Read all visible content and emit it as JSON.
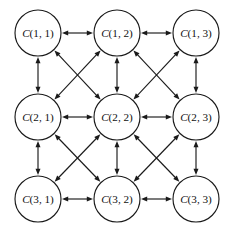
{
  "diagram": {
    "type": "directed-graph-grid",
    "title": "",
    "background_color": "#ffffff",
    "stroke_color": "#1a1a1a",
    "node_fill_color": "#ffffff",
    "label_color": "#111111",
    "node_radius": 23,
    "grid": {
      "rows": 3,
      "cols": 3
    },
    "column_centers_x": [
      38,
      117,
      196
    ],
    "row_centers_y": [
      33,
      117,
      199
    ],
    "edge_style": "bidirectional",
    "nodes": [
      {
        "id": "c11",
        "label_var": "C",
        "label_index": "(1, 1)",
        "row": 1,
        "col": 1,
        "cx": 38,
        "cy": 33
      },
      {
        "id": "c12",
        "label_var": "C",
        "label_index": "(1, 2)",
        "row": 1,
        "col": 2,
        "cx": 117,
        "cy": 33
      },
      {
        "id": "c13",
        "label_var": "C",
        "label_index": "(1, 3)",
        "row": 1,
        "col": 3,
        "cx": 196,
        "cy": 33
      },
      {
        "id": "c21",
        "label_var": "C",
        "label_index": "(2, 1)",
        "row": 2,
        "col": 1,
        "cx": 38,
        "cy": 117
      },
      {
        "id": "c22",
        "label_var": "C",
        "label_index": "(2, 2)",
        "row": 2,
        "col": 2,
        "cx": 117,
        "cy": 117
      },
      {
        "id": "c23",
        "label_var": "C",
        "label_index": "(2, 3)",
        "row": 2,
        "col": 3,
        "cx": 196,
        "cy": 117
      },
      {
        "id": "c31",
        "label_var": "C",
        "label_index": "(3, 1)",
        "row": 3,
        "col": 1,
        "cx": 38,
        "cy": 199
      },
      {
        "id": "c32",
        "label_var": "C",
        "label_index": "(3, 2)",
        "row": 3,
        "col": 2,
        "cx": 117,
        "cy": 199
      },
      {
        "id": "c33",
        "label_var": "C",
        "label_index": "(3, 3)",
        "row": 3,
        "col": 3,
        "cx": 196,
        "cy": 199
      }
    ],
    "edges": [
      {
        "from": "c11",
        "to": "c12",
        "kind": "horizontal",
        "bidirectional": true
      },
      {
        "from": "c12",
        "to": "c13",
        "kind": "horizontal",
        "bidirectional": true
      },
      {
        "from": "c21",
        "to": "c22",
        "kind": "horizontal",
        "bidirectional": true
      },
      {
        "from": "c22",
        "to": "c23",
        "kind": "horizontal",
        "bidirectional": true
      },
      {
        "from": "c31",
        "to": "c32",
        "kind": "horizontal",
        "bidirectional": true
      },
      {
        "from": "c32",
        "to": "c33",
        "kind": "horizontal",
        "bidirectional": true
      },
      {
        "from": "c11",
        "to": "c21",
        "kind": "vertical",
        "bidirectional": true
      },
      {
        "from": "c21",
        "to": "c31",
        "kind": "vertical",
        "bidirectional": true
      },
      {
        "from": "c12",
        "to": "c22",
        "kind": "vertical",
        "bidirectional": true
      },
      {
        "from": "c22",
        "to": "c32",
        "kind": "vertical",
        "bidirectional": true
      },
      {
        "from": "c13",
        "to": "c23",
        "kind": "vertical",
        "bidirectional": true
      },
      {
        "from": "c23",
        "to": "c33",
        "kind": "vertical",
        "bidirectional": true
      },
      {
        "from": "c11",
        "to": "c22",
        "kind": "diagonal",
        "bidirectional": true
      },
      {
        "from": "c12",
        "to": "c21",
        "kind": "diagonal",
        "bidirectional": true
      },
      {
        "from": "c12",
        "to": "c23",
        "kind": "diagonal",
        "bidirectional": true
      },
      {
        "from": "c13",
        "to": "c22",
        "kind": "diagonal",
        "bidirectional": true
      },
      {
        "from": "c21",
        "to": "c32",
        "kind": "diagonal",
        "bidirectional": true
      },
      {
        "from": "c22",
        "to": "c31",
        "kind": "diagonal",
        "bidirectional": true
      },
      {
        "from": "c22",
        "to": "c33",
        "kind": "diagonal",
        "bidirectional": true
      },
      {
        "from": "c23",
        "to": "c32",
        "kind": "diagonal",
        "bidirectional": true
      }
    ]
  }
}
